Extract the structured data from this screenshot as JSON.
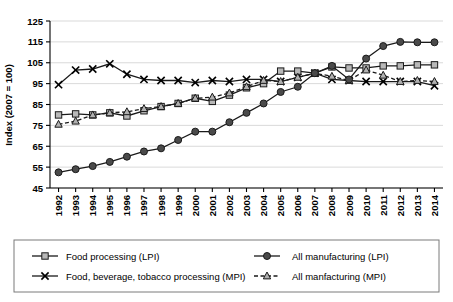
{
  "chart_data": {
    "type": "line",
    "title": "",
    "xlabel": "",
    "ylabel": "Index (2007 = 100)",
    "ylim": [
      45,
      125
    ],
    "yticks": [
      45,
      55,
      65,
      75,
      85,
      95,
      105,
      115,
      125
    ],
    "grid": true,
    "legend_position": "bottom",
    "categories": [
      1992,
      1993,
      1994,
      1995,
      1996,
      1997,
      1998,
      1999,
      2000,
      2001,
      2002,
      2003,
      2004,
      2005,
      2006,
      2007,
      2008,
      2009,
      2010,
      2011,
      2012,
      2013,
      2014
    ],
    "x": [
      "1992",
      "1993",
      "1994",
      "1995",
      "1996",
      "1997",
      "1998",
      "1999",
      "2000",
      "2001",
      "2002",
      "2003",
      "2004",
      "2005",
      "2006",
      "2007",
      "2008",
      "2009",
      "2010",
      "2011",
      "2012",
      "2013",
      "2014"
    ],
    "series": [
      {
        "name": "Food processing (LPI)",
        "marker": "square",
        "line_style": "solid",
        "values": [
          80,
          80.5,
          80,
          81,
          79.5,
          82,
          84,
          85.5,
          88,
          86.5,
          89.5,
          93,
          95,
          101,
          101,
          100,
          103,
          102.5,
          102.5,
          103.5,
          103.5,
          104,
          104
        ]
      },
      {
        "name": "Food, beverage, tobacco processing (MPI)",
        "marker": "x",
        "line_style": "solid",
        "values": [
          94.5,
          101.5,
          102,
          104.5,
          99.5,
          97,
          96.5,
          96.5,
          95.5,
          96.5,
          96,
          97,
          97,
          96,
          98,
          100,
          97,
          96.5,
          96,
          96,
          96,
          96,
          94
        ]
      },
      {
        "name": "All manufacturing (LPI)",
        "marker": "circle",
        "line_style": "solid",
        "values": [
          52.5,
          54,
          55.5,
          57.5,
          60,
          62.5,
          64,
          68,
          72,
          72,
          76.5,
          81,
          85.5,
          91,
          93.5,
          100,
          103.5,
          97,
          107,
          113,
          115,
          114.8,
          114.8
        ]
      },
      {
        "name": "All manfacturing (MPI)",
        "marker": "triangle",
        "line_style": "dashed",
        "values": [
          75.5,
          77,
          80,
          81,
          81.5,
          83,
          84,
          85.5,
          88,
          88.5,
          90.5,
          93.5,
          96.5,
          96,
          98,
          100,
          98.5,
          96.5,
          101.5,
          99,
          96,
          96.5,
          96
        ]
      }
    ],
    "legend": [
      {
        "label": "Food processing (LPI)",
        "marker": "square",
        "line_style": "solid"
      },
      {
        "label": "All manufacturing (LPI)",
        "marker": "circle",
        "line_style": "solid"
      },
      {
        "label": "Food, beverage, tobacco processing (MPI)",
        "marker": "x",
        "line_style": "solid"
      },
      {
        "label": "All manfacturing (MPI)",
        "marker": "triangle",
        "line_style": "dashed"
      }
    ],
    "colors": {
      "line": "#1a1a1a",
      "grid": "#c9c9c9",
      "square_fill": "#b8b8b8",
      "circle_fill": "#4a4a4a",
      "triangle_fill": "#b0b0b0",
      "legend_border": "#7a7a7a",
      "background": "#ffffff"
    }
  }
}
